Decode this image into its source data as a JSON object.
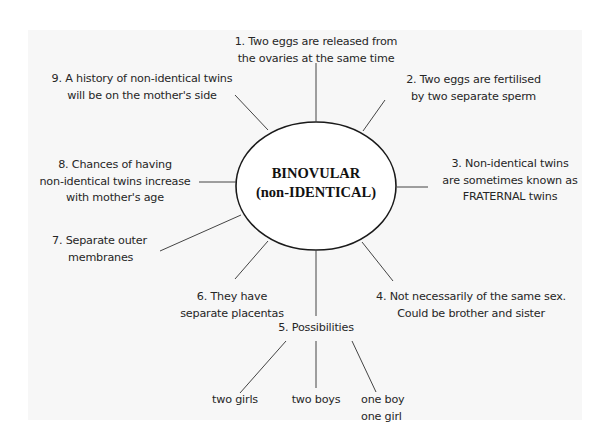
{
  "diagram": {
    "center": {
      "line1": "BINOVULAR",
      "line2": "(non-IDENTICAL)"
    },
    "nodes": [
      {
        "id": 1,
        "lines": [
          "1. Two eggs are released from",
          "the ovaries at the same time"
        ]
      },
      {
        "id": 2,
        "lines": [
          "2. Two eggs are fertilised",
          "by two separate sperm"
        ]
      },
      {
        "id": 3,
        "lines": [
          "3. Non-identical twins",
          "are sometimes known as",
          "FRATERNAL twins"
        ]
      },
      {
        "id": 4,
        "lines": [
          "4. Not necessarily of the same sex.",
          "Could be brother and sister"
        ]
      },
      {
        "id": 5,
        "lines": [
          "5. Possibilities"
        ]
      },
      {
        "id": 6,
        "lines": [
          "6. They have",
          "separate placentas"
        ]
      },
      {
        "id": 7,
        "lines": [
          "7. Separate outer",
          "membranes"
        ]
      },
      {
        "id": 8,
        "lines": [
          "8. Chances of having",
          "non-identical twins increase",
          "with mother's age"
        ]
      },
      {
        "id": 9,
        "lines": [
          "9. A history of non-identical twins",
          "will be on the mother's side"
        ]
      }
    ],
    "possibilities": [
      {
        "lines": [
          "two girls"
        ]
      },
      {
        "lines": [
          "two boys"
        ]
      },
      {
        "lines": [
          "one boy",
          "one girl"
        ]
      }
    ]
  },
  "colors": {
    "background": "#ffffff",
    "panel": "#f7f7f7",
    "stroke": "#1a1a1a",
    "text": "#262626"
  }
}
